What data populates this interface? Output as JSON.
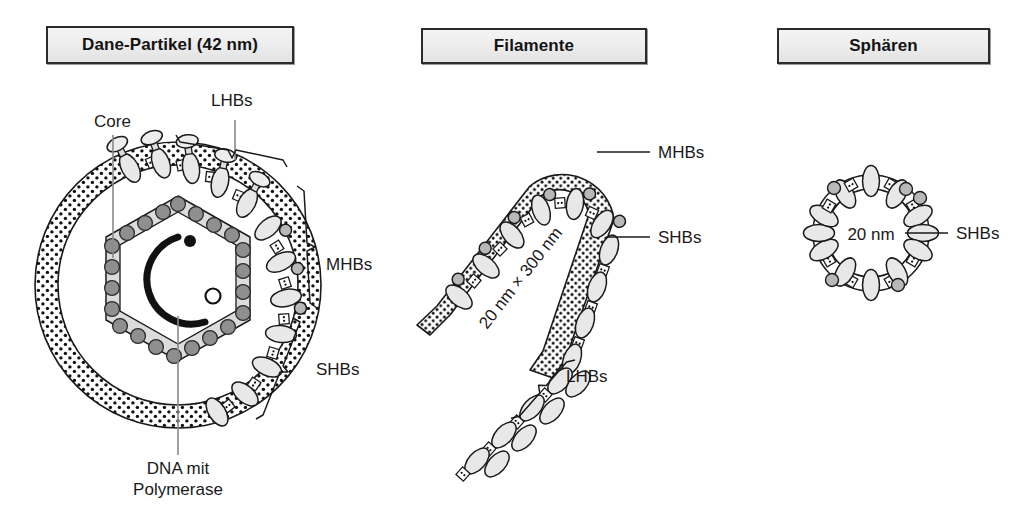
{
  "figure": {
    "background": "#ffffff",
    "ink": "#1a1a1a"
  },
  "panels": [
    {
      "id": "dane",
      "title": "Dane-Partikel (42 nm)",
      "labels": [
        {
          "name": "core",
          "text": "Core"
        },
        {
          "name": "lhbs",
          "text": "LHBs"
        },
        {
          "name": "mhbs",
          "text": "MHBs"
        },
        {
          "name": "shbs",
          "text": "SHBs"
        },
        {
          "name": "dna",
          "text": "DNA mit\nPolymerase"
        }
      ],
      "dna_line1": "DNA mit",
      "dna_line2": "Polymerase",
      "structure": {
        "envelope": "gepunktete Lipidhuelle",
        "capsid": "hexagonales Kapsid mit Kapsomeren",
        "genome": "zirkulaere DNA mit Polymerase"
      }
    },
    {
      "id": "filamente",
      "title": "Filamente",
      "dimension": "20 nm × 300 nm",
      "labels": [
        {
          "name": "mhbs",
          "text": "MHBs"
        },
        {
          "name": "shbs",
          "text": "SHBs"
        },
        {
          "name": "lhbs",
          "text": "LHBs"
        }
      ]
    },
    {
      "id": "sphaeren",
      "title": "Sphären",
      "dimension": "20 nm",
      "labels": [
        {
          "name": "shbs",
          "text": "SHBs"
        }
      ]
    }
  ],
  "legend_terms": {
    "lhbs": "LHBs",
    "mhbs": "MHBs",
    "shbs": "SHBs",
    "core": "Core"
  },
  "colors": {
    "outline": "#1a1a1a",
    "protein_fill": "#e6e6e6",
    "knob_fill": "#b4b4b4",
    "capsomere_fill": "#8c8c8c",
    "capsid_band": "#d9d9d9",
    "title_box_fill": "#ececec",
    "leader_line": "#8a8a8a"
  }
}
